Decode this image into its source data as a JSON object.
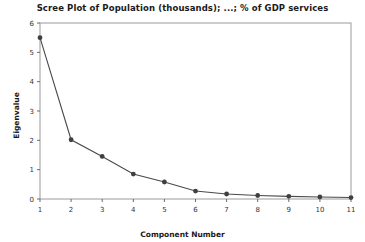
{
  "chart_data": {
    "type": "line",
    "title": "Scree Plot of Population (thousands); ...; % of GDP services",
    "xlabel": "Component Number",
    "ylabel": "Eigenvalue",
    "x": [
      1,
      2,
      3,
      4,
      5,
      6,
      7,
      8,
      9,
      10,
      11
    ],
    "values": [
      5.5,
      2.02,
      1.45,
      0.85,
      0.58,
      0.27,
      0.17,
      0.12,
      0.09,
      0.07,
      0.05
    ],
    "categories": [
      "1",
      "2",
      "3",
      "4",
      "5",
      "6",
      "7",
      "8",
      "9",
      "10",
      "11"
    ],
    "xtick_labels": [
      "1",
      "2",
      "3",
      "4",
      "5",
      "6",
      "7",
      "8",
      "9",
      "10",
      "11"
    ],
    "ytick_labels": [
      "0",
      "1",
      "2",
      "3",
      "4",
      "5",
      "6"
    ],
    "yticks": [
      0,
      1,
      2,
      3,
      4,
      5,
      6
    ],
    "xlim": [
      1,
      11
    ],
    "ylim": [
      0,
      6
    ],
    "grid": false,
    "legend": false,
    "marker": "circle",
    "line_color": "#4a4a4a",
    "marker_color": "#3f3f3f",
    "frame_color": "#9a9a9a",
    "background": "#ffffff"
  }
}
